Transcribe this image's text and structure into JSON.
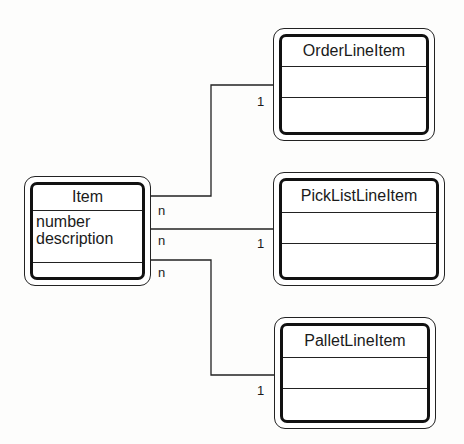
{
  "diagram": {
    "type": "class-diagram",
    "classes": [
      {
        "id": "item",
        "name": "Item",
        "attributes": [
          "number",
          "description"
        ]
      },
      {
        "id": "order",
        "name": "OrderLineItem",
        "attributes": []
      },
      {
        "id": "pick",
        "name": "PickListLineItem",
        "attributes": []
      },
      {
        "id": "pallet",
        "name": "PalletLineItem",
        "attributes": []
      }
    ],
    "associations": [
      {
        "from": "item",
        "to": "order",
        "from_mult": "n",
        "to_mult": "1"
      },
      {
        "from": "item",
        "to": "pick",
        "from_mult": "n",
        "to_mult": "1"
      },
      {
        "from": "item",
        "to": "pallet",
        "from_mult": "n",
        "to_mult": "1"
      }
    ]
  }
}
